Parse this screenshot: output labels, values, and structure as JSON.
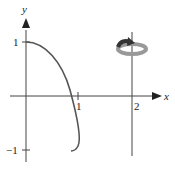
{
  "diagram": {
    "type": "solid-of-revolution sketch",
    "axes": {
      "x_label": "x",
      "y_label": "y",
      "x_ticks": [
        "1",
        "2"
      ],
      "y_ticks": [
        "1",
        "−1"
      ]
    },
    "curve": {
      "description": "curve from (0,1) descending through (≈0.85,0) to (≈1,−1) with slight hook at bottom",
      "color": "#555555"
    },
    "axis_of_rotation": {
      "equation": "x = 2",
      "color": "#444444"
    },
    "rotation_icon": {
      "name": "rotation-arrow-icon",
      "ring_color": "#999999",
      "arrow_color": "#333333"
    }
  }
}
